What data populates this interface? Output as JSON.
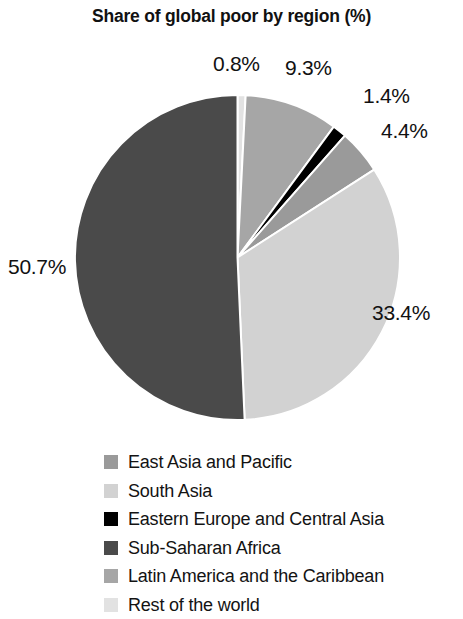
{
  "chart_data": {
    "type": "pie",
    "title": "Share of global poor by region (%)",
    "xlabel": "",
    "ylabel": "",
    "grid": false,
    "legend_position": "bottom-left",
    "start_angle_deg": 0,
    "direction": "clockwise",
    "categories": [
      "East Asia and Pacific",
      "South Asia",
      "Eastern Europe and Central Asia",
      "Sub-Saharan Africa",
      "Latin America and the Caribbean",
      "Rest of the world"
    ],
    "values": [
      4.4,
      33.4,
      1.4,
      50.7,
      9.3,
      0.8
    ],
    "colors": [
      "#9a9a9a",
      "#d2d2d2",
      "#000000",
      "#4a4a4a",
      "#a6a6a6",
      "#e2e2e2"
    ],
    "slices": [
      {
        "name": "Rest of the world",
        "value": 0.8,
        "label": "0.8%",
        "color": "#e2e2e2",
        "order": 1
      },
      {
        "name": "Latin America and the Caribbean",
        "value": 9.3,
        "label": "9.3%",
        "color": "#a6a6a6",
        "order": 2
      },
      {
        "name": "Eastern Europe and Central Asia",
        "value": 1.4,
        "label": "1.4%",
        "color": "#000000",
        "order": 3
      },
      {
        "name": "East Asia and Pacific",
        "value": 4.4,
        "label": "4.4%",
        "color": "#9a9a9a",
        "order": 4
      },
      {
        "name": "South Asia",
        "value": 33.4,
        "label": "33.4%",
        "color": "#d2d2d2",
        "order": 5
      },
      {
        "name": "Sub-Saharan Africa",
        "value": 50.7,
        "label": "50.7%",
        "color": "#4a4a4a",
        "order": 6
      }
    ]
  },
  "labels": {
    "rest_of_world": "0.8%",
    "latin_america": "9.3%",
    "eastern_europe": "1.4%",
    "east_asia": "4.4%",
    "south_asia": "33.4%",
    "sub_saharan": "50.7%"
  },
  "legend": {
    "items": [
      {
        "label": "East Asia and Pacific",
        "color": "#9a9a9a"
      },
      {
        "label": "South Asia",
        "color": "#d2d2d2"
      },
      {
        "label": "Eastern Europe and Central Asia",
        "color": "#000000"
      },
      {
        "label": "Sub-Saharan Africa",
        "color": "#4a4a4a"
      },
      {
        "label": "Latin America and the Caribbean",
        "color": "#a6a6a6"
      },
      {
        "label": "Rest of the world",
        "color": "#e2e2e2"
      }
    ]
  }
}
